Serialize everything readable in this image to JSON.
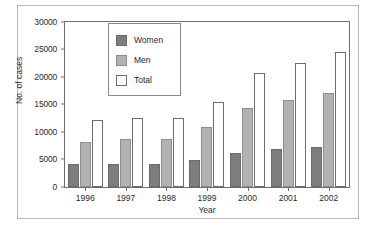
{
  "chart_data": {
    "type": "bar",
    "title": "",
    "xlabel": "Year",
    "ylabel": "No. of cases",
    "categories": [
      "1996",
      "1997",
      "1998",
      "1999",
      "2000",
      "2001",
      "2002"
    ],
    "series": [
      {
        "name": "Women",
        "color": "#7d7d7d",
        "values": [
          4200,
          4200,
          4200,
          4900,
          6200,
          6900,
          7300
        ]
      },
      {
        "name": "Men",
        "color": "#b2b2b2",
        "values": [
          8200,
          8700,
          8700,
          10900,
          14400,
          15800,
          17100
        ]
      },
      {
        "name": "Total",
        "color": "#ffffff",
        "values": [
          12100,
          12600,
          12600,
          15500,
          20800,
          22600,
          24500
        ]
      }
    ],
    "ylim": [
      0,
      30000
    ],
    "yticks": [
      0,
      5000,
      10000,
      15000,
      20000,
      25000,
      30000
    ],
    "ytick_labels": [
      "0",
      "5000",
      "10000",
      "15000",
      "20000",
      "25000",
      "30000"
    ],
    "grid": false,
    "legend_position": "top-left-inside",
    "legend": [
      "Women",
      "Men",
      "Total"
    ]
  }
}
